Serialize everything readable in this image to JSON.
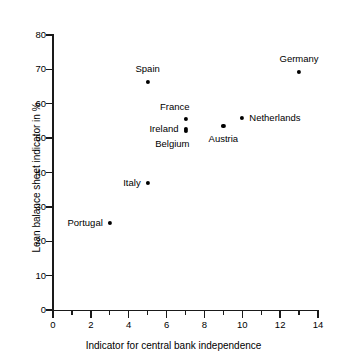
{
  "chart_data": {
    "type": "scatter",
    "title": "",
    "xlabel": "Indicator for central bank independence",
    "ylabel": "Lean balance sheet indicator in %",
    "xlim": [
      0,
      14
    ],
    "ylim": [
      0,
      80
    ],
    "xticks": [
      0,
      2,
      4,
      6,
      8,
      10,
      12,
      14
    ],
    "yticks": [
      0,
      10,
      20,
      30,
      40,
      50,
      60,
      70,
      80
    ],
    "x_minor_ticks": [
      1,
      3,
      5,
      7,
      9,
      11,
      13
    ],
    "grid": false,
    "legend": false,
    "marker_color": "#000000",
    "points": [
      {
        "label": "Portugal",
        "x": 3.0,
        "y": 25.3,
        "label_pos": "left"
      },
      {
        "label": "Spain",
        "x": 5.0,
        "y": 66.3,
        "label_pos": "above"
      },
      {
        "label": "Italy",
        "x": 5.0,
        "y": 37.0,
        "label_pos": "left"
      },
      {
        "label": "France",
        "x": 7.0,
        "y": 55.5,
        "label_pos": "above-left"
      },
      {
        "label": "Ireland",
        "x": 7.0,
        "y": 52.7,
        "label_pos": "left"
      },
      {
        "label": "Belgium",
        "x": 7.0,
        "y": 52.0,
        "label_pos": "below-left"
      },
      {
        "label": "Austria",
        "x": 9.0,
        "y": 53.5,
        "label_pos": "below"
      },
      {
        "label": "Netherlands",
        "x": 10.0,
        "y": 55.8,
        "label_pos": "right"
      },
      {
        "label": "Germany",
        "x": 13.0,
        "y": 69.2,
        "label_pos": "above"
      }
    ]
  }
}
